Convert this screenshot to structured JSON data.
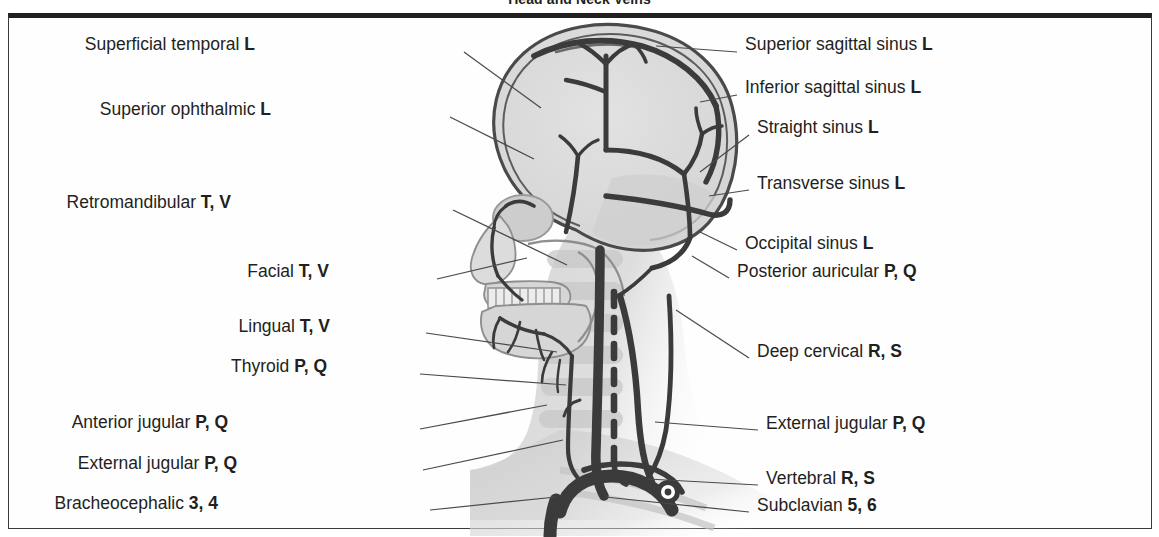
{
  "figure": {
    "title": "Head and Neck Veins",
    "frame_color": "#231f20",
    "background_color": "#ffffff",
    "vessel_color": "#3b3b3b",
    "bone_fill": "#d9d9d9",
    "leader_color": "#4a4a4a"
  },
  "labels_left": [
    {
      "name": "Superficial temporal",
      "code": "L",
      "x": 255,
      "y": 45,
      "anchor_x": 464,
      "anchor_y": 52,
      "line_to_x": 541,
      "line_to_y": 108
    },
    {
      "name": "Superior ophthalmic",
      "code": "L",
      "x": 271,
      "y": 110,
      "anchor_x": 450,
      "anchor_y": 117,
      "line_to_x": 534,
      "line_to_y": 159
    },
    {
      "name": "Retromandibular",
      "code": "T, V",
      "x": 231,
      "y": 203,
      "anchor_x": 453,
      "anchor_y": 210,
      "line_to_x": 567,
      "line_to_y": 265
    },
    {
      "name": "Facial",
      "code": "T, V",
      "x": 329,
      "y": 272,
      "anchor_x": 437,
      "anchor_y": 279,
      "line_to_x": 527,
      "line_to_y": 258
    },
    {
      "name": "Lingual",
      "code": "T, V",
      "x": 330,
      "y": 327,
      "anchor_x": 426,
      "anchor_y": 333,
      "line_to_x": 557,
      "line_to_y": 352
    },
    {
      "name": "Thyroid",
      "code": "P, Q",
      "x": 327,
      "y": 367,
      "anchor_x": 420,
      "anchor_y": 374,
      "line_to_x": 566,
      "line_to_y": 385
    },
    {
      "name": "Anterior jugular",
      "code": "P, Q",
      "x": 228,
      "y": 423,
      "anchor_x": 420,
      "anchor_y": 429,
      "line_to_x": 547,
      "line_to_y": 405
    },
    {
      "name": "External jugular",
      "code": "P, Q",
      "x": 237,
      "y": 464,
      "anchor_x": 423,
      "anchor_y": 470,
      "line_to_x": 563,
      "line_to_y": 440
    },
    {
      "name": "Bracheocephalic",
      "code": "3, 4",
      "x": 218,
      "y": 504,
      "anchor_x": 430,
      "anchor_y": 510,
      "line_to_x": 556,
      "line_to_y": 497
    }
  ],
  "labels_right": [
    {
      "name": "Superior sagittal sinus",
      "code": "L",
      "x": 745,
      "y": 45,
      "anchor_x": 737,
      "anchor_y": 52,
      "line_to_x": 656,
      "line_to_y": 46
    },
    {
      "name": "Inferior sagittal sinus",
      "code": "L",
      "x": 745,
      "y": 88,
      "anchor_x": 737,
      "anchor_y": 95,
      "line_to_x": 700,
      "line_to_y": 102
    },
    {
      "name": "Straight sinus",
      "code": "L",
      "x": 757,
      "y": 128,
      "anchor_x": 749,
      "anchor_y": 135,
      "line_to_x": 700,
      "line_to_y": 172
    },
    {
      "name": "Transverse sinus",
      "code": "L",
      "x": 757,
      "y": 184,
      "anchor_x": 749,
      "anchor_y": 190,
      "line_to_x": 709,
      "line_to_y": 196
    },
    {
      "name": "Occipital sinus",
      "code": "L",
      "x": 745,
      "y": 244,
      "anchor_x": 737,
      "anchor_y": 250,
      "line_to_x": 700,
      "line_to_y": 232
    },
    {
      "name": "Posterior auricular",
      "code": "P, Q",
      "x": 737,
      "y": 272,
      "anchor_x": 729,
      "anchor_y": 278,
      "line_to_x": 692,
      "line_to_y": 256
    },
    {
      "name": "Deep cervical",
      "code": "R, S",
      "x": 757,
      "y": 352,
      "anchor_x": 749,
      "anchor_y": 358,
      "line_to_x": 676,
      "line_to_y": 310
    },
    {
      "name": "External jugular",
      "code": "P, Q",
      "x": 766,
      "y": 424,
      "anchor_x": 758,
      "anchor_y": 430,
      "line_to_x": 655,
      "line_to_y": 422
    },
    {
      "name": "Vertebral",
      "code": "R, S",
      "x": 766,
      "y": 479,
      "anchor_x": 758,
      "anchor_y": 485,
      "line_to_x": 648,
      "line_to_y": 479
    },
    {
      "name": "Subclavian",
      "code": "5, 6",
      "x": 757,
      "y": 506,
      "anchor_x": 749,
      "anchor_y": 512,
      "line_to_x": 605,
      "line_to_y": 497
    }
  ]
}
